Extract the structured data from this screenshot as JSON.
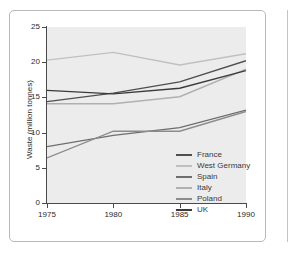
{
  "chart_data": {
    "type": "line",
    "title": "",
    "xlabel": "",
    "ylabel": "Waste (million tonnes)",
    "x": [
      1975,
      1980,
      1985,
      1990
    ],
    "xticklabels": [
      "1975",
      "1980",
      "1985",
      "1990"
    ],
    "xlim": [
      1975,
      1990
    ],
    "ylim": [
      0,
      25
    ],
    "yticks": [
      0,
      5,
      10,
      15,
      20,
      25
    ],
    "yticklabels": [
      "0",
      "5",
      "10",
      "15",
      "20",
      "25"
    ],
    "grid": false,
    "legend_position": "inside-bottom-right",
    "plot_background": "#ececec",
    "series": [
      {
        "name": "France",
        "values": [
          14.4,
          15.6,
          17.2,
          20.2
        ],
        "color": "#4f4f4f"
      },
      {
        "name": "West Germany",
        "values": [
          20.3,
          21.4,
          19.6,
          21.2
        ],
        "color": "#c0c0c0"
      },
      {
        "name": "Spain",
        "values": [
          8.0,
          9.6,
          10.7,
          13.2
        ],
        "color": "#6e6e6e"
      },
      {
        "name": "Italy",
        "values": [
          14.1,
          14.1,
          15.1,
          19.0
        ],
        "color": "#b0b0b0"
      },
      {
        "name": "Poland",
        "values": [
          6.4,
          10.2,
          10.2,
          13.0
        ],
        "color": "#8c8c8c"
      },
      {
        "name": "UK",
        "values": [
          16.0,
          15.5,
          16.3,
          18.8
        ],
        "color": "#3a3a3a"
      }
    ]
  },
  "legend": {
    "items": [
      {
        "label": "France"
      },
      {
        "label": "West Germany"
      },
      {
        "label": "Spain"
      },
      {
        "label": "Italy"
      },
      {
        "label": "Poland"
      },
      {
        "label": "UK"
      }
    ]
  }
}
